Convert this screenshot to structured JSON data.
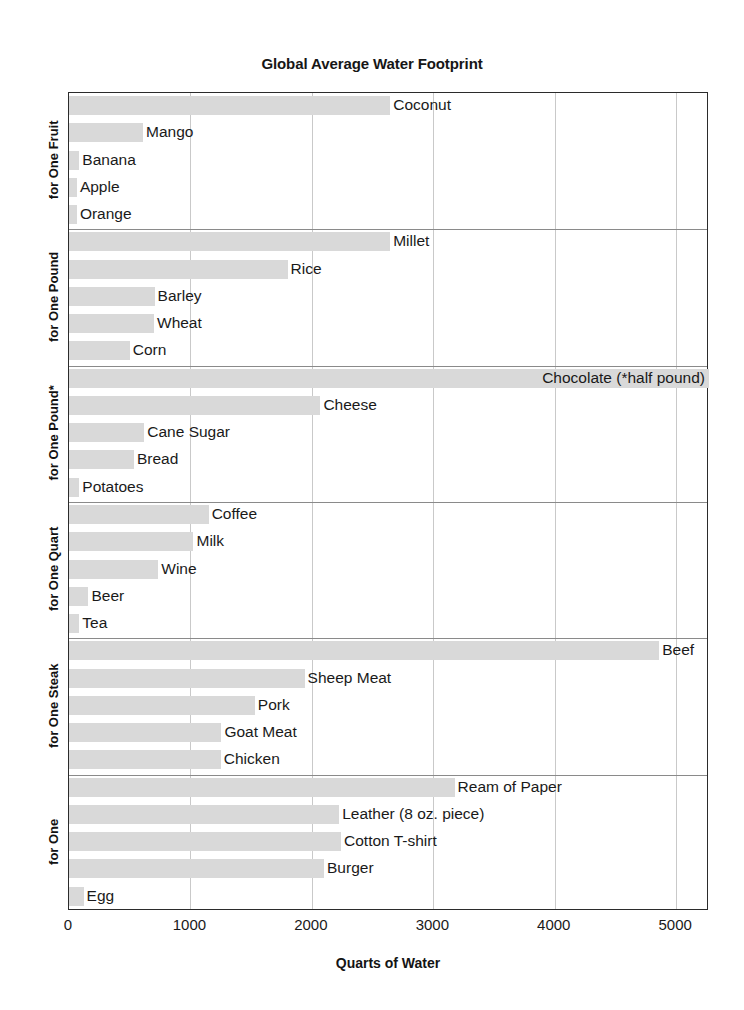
{
  "chart_data": {
    "type": "bar",
    "orientation": "horizontal",
    "title": "Global Average Water Footprint",
    "xlabel": "Quarts of Water",
    "ylabel": "",
    "xlim": [
      0,
      5270
    ],
    "xticks": [
      0,
      1000,
      2000,
      3000,
      4000,
      5000
    ],
    "xticklabels": [
      "0",
      "1000",
      "2000",
      "3000",
      "4000",
      "5000"
    ],
    "grid": "vertical",
    "legend": "none",
    "bar_color": "#d9d9d9",
    "groups": [
      {
        "label": "for One Fruit",
        "categories": [
          "Coconut",
          "Mango",
          "Banana",
          "Apple",
          "Orange"
        ],
        "values": [
          2645,
          610,
          85,
          65,
          65
        ]
      },
      {
        "label": "for One Pound",
        "categories": [
          "Millet",
          "Rice",
          "Barley",
          "Wheat",
          "Corn"
        ],
        "values": [
          2645,
          1800,
          705,
          700,
          500
        ]
      },
      {
        "label": "for One Pound*",
        "categories": [
          "Chocolate (*half pound)",
          "Cheese",
          "Cane Sugar",
          "Bread",
          "Potatoes"
        ],
        "values": [
          5270,
          2070,
          620,
          535,
          85
        ]
      },
      {
        "label": "for One Quart",
        "categories": [
          "Coffee",
          "Milk",
          "Wine",
          "Beer",
          "Tea"
        ],
        "values": [
          1150,
          1025,
          735,
          160,
          85
        ]
      },
      {
        "label": "for One Steak",
        "categories": [
          "Beef",
          "Sheep Meat",
          "Pork",
          "Goat Meat",
          "Chicken"
        ],
        "values": [
          4860,
          1940,
          1530,
          1255,
          1250
        ]
      },
      {
        "label": "for One",
        "categories": [
          "Ream of Paper",
          "Leather (8 oz. piece)",
          "Cotton T-shirt",
          "Burger",
          "Egg"
        ],
        "values": [
          3175,
          2225,
          2240,
          2100,
          120
        ]
      }
    ]
  }
}
